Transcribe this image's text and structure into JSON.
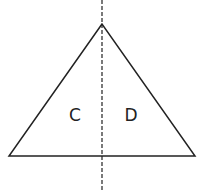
{
  "diagram": {
    "shape": "triangle",
    "apex": [
      102,
      24
    ],
    "base_left": [
      9,
      156
    ],
    "base_right": [
      195,
      156
    ],
    "axis": {
      "x": 102,
      "y1": 0,
      "y2": 190,
      "style": "dashed"
    },
    "labels": {
      "left": "C",
      "right": "D"
    },
    "stroke_color": "#222222"
  }
}
